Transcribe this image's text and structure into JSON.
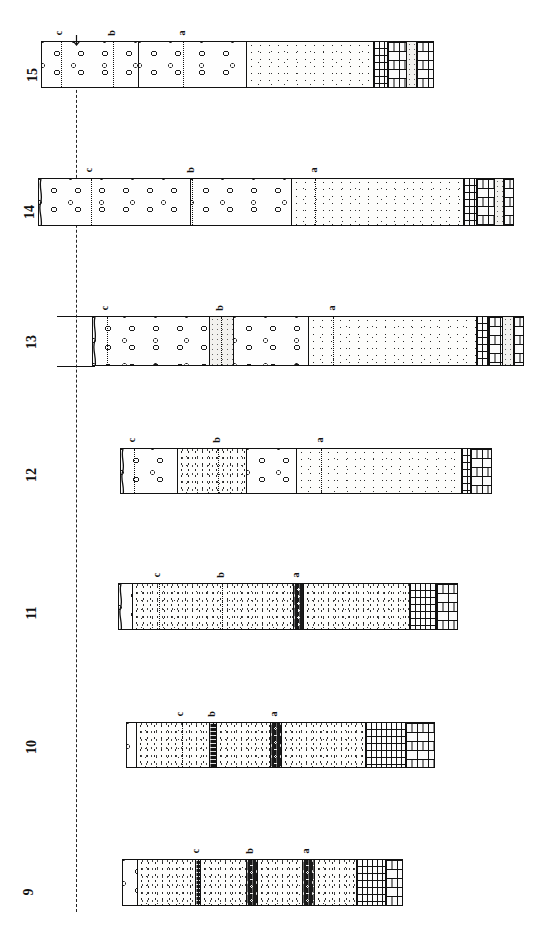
{
  "figure": {
    "type": "stratigraphic-correlation-diagram",
    "orientation": "columns-drawn-horizontally-labels-rotated-90ccw",
    "width": 538,
    "height": 937,
    "background": "#ffffff",
    "ink_color": "#111111"
  },
  "datum": {
    "name": "vertical-datum-line",
    "style": "dashed",
    "x": 76,
    "y_top": 45,
    "y_bottom": 912
  },
  "marker_horizons": {
    "labels": [
      "a",
      "b",
      "c"
    ],
    "style": "dotted",
    "note": "correlation markers a (lowest/right), b, c (highest/left)"
  },
  "legend_keys": {
    "conglomerate": "open-circle pebble pattern",
    "sandstone": "fine stipple",
    "sandstone_coarse": "dense stipple",
    "limestone": "brick pattern",
    "shale": "dark laminated band",
    "shale_clastic": "dark band with light clasts",
    "silt": "pale fine stipple",
    "interbed": "vertical ruled limestone-shale interbed"
  },
  "sections": [
    {
      "id": "15",
      "label": "15",
      "label_x": 26,
      "label_y": 68,
      "x": 41,
      "y": 41,
      "width": 393,
      "height": 47,
      "wavy_left_edge": false,
      "arrow_marker": {
        "present": true,
        "x_offset": 35
      },
      "beds": [
        {
          "name": "bed-conglomerate-1",
          "lithology": "conglomerate",
          "x": 0,
          "width": 97
        },
        {
          "name": "bed-conglomerate-2",
          "lithology": "conglomerate",
          "x": 97,
          "width": 108
        },
        {
          "name": "bed-sandstone",
          "lithology": "sandstone",
          "x": 205,
          "width": 127
        },
        {
          "name": "bed-interbed",
          "lithology": "interbed",
          "x": 332,
          "width": 14
        },
        {
          "name": "bed-limestone-1",
          "lithology": "limestone",
          "x": 346,
          "width": 19
        },
        {
          "name": "bed-silt",
          "lithology": "silt",
          "x": 365,
          "width": 10
        },
        {
          "name": "bed-limestone-2",
          "lithology": "limestone",
          "x": 375,
          "width": 18
        }
      ],
      "markers": [
        {
          "label": "c",
          "x": 19
        },
        {
          "label": "b",
          "x": 71
        },
        {
          "label": "a",
          "x": 141
        }
      ]
    },
    {
      "id": "14",
      "label": "14",
      "label_x": 23,
      "label_y": 205,
      "x": 38,
      "y": 178,
      "width": 476,
      "height": 48,
      "wavy_left_edge": true,
      "arrow_marker": {
        "present": false,
        "x_offset": 0
      },
      "beds": [
        {
          "name": "bed-conglomerate-1",
          "lithology": "conglomerate",
          "x": 0,
          "width": 152
        },
        {
          "name": "bed-conglomerate-2",
          "lithology": "conglomerate",
          "x": 152,
          "width": 101
        },
        {
          "name": "bed-sandstone",
          "lithology": "sandstone",
          "x": 253,
          "width": 172
        },
        {
          "name": "bed-interbed",
          "lithology": "interbed",
          "x": 425,
          "width": 13
        },
        {
          "name": "bed-limestone-1",
          "lithology": "limestone",
          "x": 438,
          "width": 18
        },
        {
          "name": "bed-silt",
          "lithology": "silt",
          "x": 456,
          "width": 9
        },
        {
          "name": "bed-limestone-2",
          "lithology": "limestone",
          "x": 465,
          "width": 11
        }
      ],
      "markers": [
        {
          "label": "c",
          "x": 52
        },
        {
          "label": "b",
          "x": 153
        },
        {
          "label": "a",
          "x": 276
        }
      ]
    },
    {
      "id": "13",
      "label": "13",
      "label_x": 25,
      "label_y": 335,
      "x": 92,
      "y": 316,
      "width": 432,
      "height": 50,
      "wavy_left_edge": true,
      "arrow_marker": {
        "present": false,
        "x_offset": 0
      },
      "datum_ticks": [
        {
          "name": "datum-tick-top",
          "x": -35,
          "y": 0,
          "width": 38
        },
        {
          "name": "datum-tick-bottom",
          "x": -35,
          "y": 50,
          "width": 38
        }
      ],
      "beds": [
        {
          "name": "bed-conglomerate-1",
          "lithology": "conglomerate",
          "x": 0,
          "width": 117
        },
        {
          "name": "bed-silt-band",
          "lithology": "silt",
          "x": 117,
          "width": 24
        },
        {
          "name": "bed-conglomerate-2",
          "lithology": "conglomerate",
          "x": 141,
          "width": 75
        },
        {
          "name": "bed-sandstone",
          "lithology": "sandstone",
          "x": 216,
          "width": 168
        },
        {
          "name": "bed-interbed",
          "lithology": "interbed",
          "x": 384,
          "width": 12
        },
        {
          "name": "bed-limestone-1",
          "lithology": "limestone",
          "x": 396,
          "width": 14
        },
        {
          "name": "bed-silt",
          "lithology": "silt",
          "x": 410,
          "width": 11
        },
        {
          "name": "bed-limestone-2",
          "lithology": "limestone",
          "x": 421,
          "width": 11
        }
      ],
      "markers": [
        {
          "label": "c",
          "x": 14
        },
        {
          "label": "b",
          "x": 128
        },
        {
          "label": "a",
          "x": 240
        }
      ]
    },
    {
      "id": "12",
      "label": "12",
      "label_x": 25,
      "label_y": 468,
      "x": 120,
      "y": 448,
      "width": 372,
      "height": 46,
      "wavy_left_edge": true,
      "arrow_marker": {
        "present": false,
        "x_offset": 0
      },
      "beds": [
        {
          "name": "bed-conglomerate-1",
          "lithology": "conglomerate",
          "x": 0,
          "width": 57
        },
        {
          "name": "bed-sandstone-1",
          "lithology": "sandstone-coarse",
          "x": 57,
          "width": 69
        },
        {
          "name": "bed-conglomerate-2",
          "lithology": "conglomerate",
          "x": 126,
          "width": 50
        },
        {
          "name": "bed-sandstone-2",
          "lithology": "sandstone",
          "x": 176,
          "width": 165
        },
        {
          "name": "bed-interbed",
          "lithology": "interbed",
          "x": 341,
          "width": 9
        },
        {
          "name": "bed-limestone",
          "lithology": "limestone",
          "x": 350,
          "width": 22
        }
      ],
      "markers": [
        {
          "label": "c",
          "x": 13
        },
        {
          "label": "b",
          "x": 97
        },
        {
          "label": "a",
          "x": 200
        }
      ]
    },
    {
      "id": "11",
      "label": "11",
      "label_x": 25,
      "label_y": 606,
      "x": 118,
      "y": 583,
      "width": 340,
      "height": 47,
      "wavy_left_edge": true,
      "arrow_marker": {
        "present": false,
        "x_offset": 0
      },
      "beds": [
        {
          "name": "bed-conglomerate",
          "lithology": "conglomerate",
          "x": 0,
          "width": 14
        },
        {
          "name": "bed-sandstone-1",
          "lithology": "sandstone-coarse",
          "x": 14,
          "width": 161
        },
        {
          "name": "bed-shale-marker-a",
          "lithology": "shale-clastic",
          "x": 175,
          "width": 10
        },
        {
          "name": "bed-sandstone-2",
          "lithology": "sandstone-coarse",
          "x": 185,
          "width": 106
        },
        {
          "name": "bed-interbed",
          "lithology": "interbed",
          "x": 291,
          "width": 27
        },
        {
          "name": "bed-limestone",
          "lithology": "limestone",
          "x": 318,
          "width": 22
        }
      ],
      "markers": [
        {
          "label": "c",
          "x": 40
        },
        {
          "label": "b",
          "x": 103
        },
        {
          "label": "a",
          "x": 178
        }
      ]
    },
    {
      "id": "10",
      "label": "10",
      "label_x": 25,
      "label_y": 740,
      "x": 126,
      "y": 722,
      "width": 309,
      "height": 46,
      "wavy_left_edge": false,
      "arrow_marker": {
        "present": false,
        "x_offset": 0
      },
      "beds": [
        {
          "name": "bed-conglomerate",
          "lithology": "conglomerate",
          "x": 0,
          "width": 10
        },
        {
          "name": "bed-sandstone-1",
          "lithology": "sandstone-coarse",
          "x": 10,
          "width": 73
        },
        {
          "name": "bed-shale-marker-b",
          "lithology": "shale",
          "x": 83,
          "width": 7
        },
        {
          "name": "bed-sandstone-2",
          "lithology": "sandstone-coarse",
          "x": 90,
          "width": 54
        },
        {
          "name": "bed-shale-marker-a",
          "lithology": "shale-clastic",
          "x": 144,
          "width": 11
        },
        {
          "name": "bed-sandstone-3",
          "lithology": "sandstone-coarse",
          "x": 155,
          "width": 84
        },
        {
          "name": "bed-interbed",
          "lithology": "interbed",
          "x": 239,
          "width": 40
        },
        {
          "name": "bed-limestone",
          "lithology": "limestone",
          "x": 279,
          "width": 30
        }
      ],
      "markers": [
        {
          "label": "c",
          "x": 55
        },
        {
          "label": "b",
          "x": 86
        },
        {
          "label": "a",
          "x": 148
        }
      ]
    },
    {
      "id": "9",
      "label": "9",
      "label_x": 25,
      "label_y": 885,
      "x": 122,
      "y": 859,
      "width": 281,
      "height": 47,
      "wavy_left_edge": false,
      "arrow_marker": {
        "present": false,
        "x_offset": 0
      },
      "beds": [
        {
          "name": "bed-conglomerate",
          "lithology": "conglomerate",
          "x": 0,
          "width": 15
        },
        {
          "name": "bed-sandstone-1",
          "lithology": "sandstone-coarse",
          "x": 15,
          "width": 58
        },
        {
          "name": "bed-shale-marker-c",
          "lithology": "shale",
          "x": 73,
          "width": 5
        },
        {
          "name": "bed-sandstone-2",
          "lithology": "sandstone-coarse",
          "x": 78,
          "width": 46
        },
        {
          "name": "bed-shale-marker-b",
          "lithology": "shale-clastic",
          "x": 124,
          "width": 11
        },
        {
          "name": "bed-sandstone-3",
          "lithology": "sandstone-coarse",
          "x": 135,
          "width": 45
        },
        {
          "name": "bed-shale-marker-a",
          "lithology": "shale-clastic",
          "x": 180,
          "width": 12
        },
        {
          "name": "bed-sandstone-4",
          "lithology": "sandstone-coarse",
          "x": 192,
          "width": 42
        },
        {
          "name": "bed-interbed",
          "lithology": "interbed",
          "x": 234,
          "width": 29
        },
        {
          "name": "bed-limestone",
          "lithology": "limestone",
          "x": 263,
          "width": 18
        }
      ],
      "markers": [
        {
          "label": "c",
          "x": 75
        },
        {
          "label": "b",
          "x": 128
        },
        {
          "label": "a",
          "x": 184
        }
      ]
    }
  ]
}
